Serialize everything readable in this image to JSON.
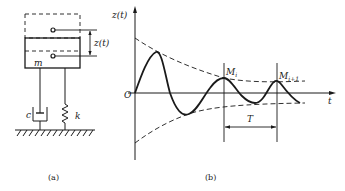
{
  "figure": {
    "panel_a": {
      "caption": "(a)",
      "mass_label": "m",
      "displacement_label": "z(t)",
      "damper_label": "c",
      "spring_label": "k"
    },
    "panel_b": {
      "caption": "(b)",
      "y_axis_label": "z(t)",
      "x_axis_label": "t",
      "origin_label": "O",
      "peak_i_label": "M",
      "peak_i_sub": "i",
      "peak_i1_label": "M",
      "peak_i1_sub": "i+1",
      "period_label": "T"
    },
    "colors": {
      "ink": "#1a1a1a",
      "background": "#ffffff"
    }
  }
}
